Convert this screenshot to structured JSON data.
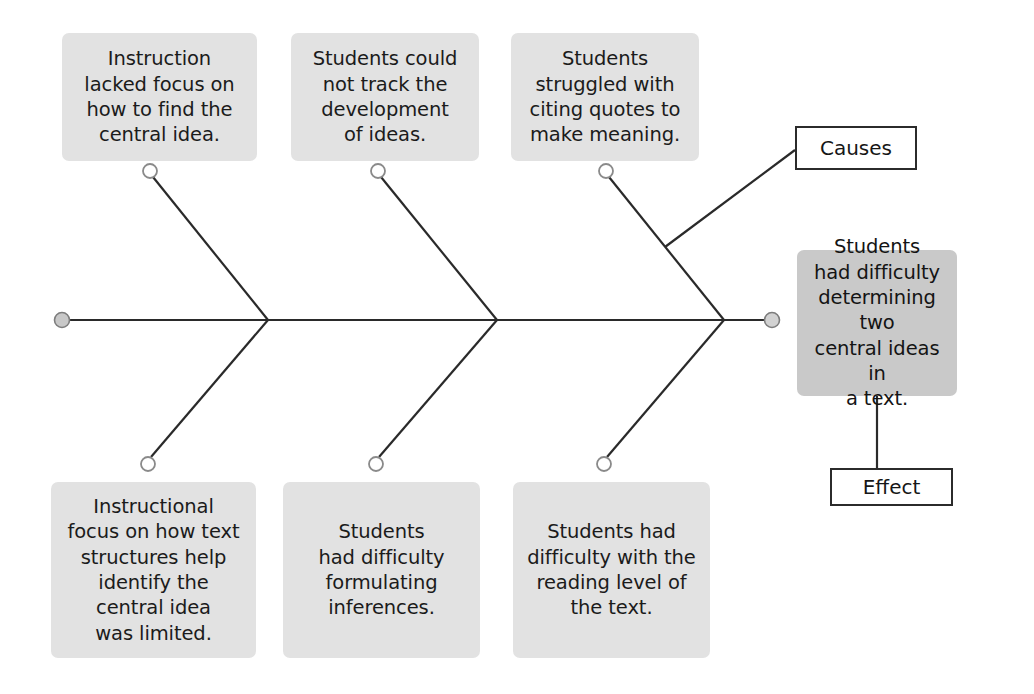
{
  "diagram": {
    "type": "fishbone-cause-and-effect",
    "title": "",
    "background_color": "#ffffff",
    "cause_box_color": "#e2e2e2",
    "effect_box_color": "#c9c9c9",
    "line_color": "#2a2a2a",
    "node_fill_color": "#ffffff",
    "node_stroke_color": "#8a8a8a",
    "spine_cap_fill_color": "#c8c8c8"
  },
  "labels": {
    "causes": "Causes",
    "effect": "Effect"
  },
  "causes_top": [
    {
      "id": "cause-top-1",
      "text": "Instruction\nlacked focus on\nhow to find the\ncentral idea."
    },
    {
      "id": "cause-top-2",
      "text": "Students could\nnot track the\ndevelopment\nof ideas."
    },
    {
      "id": "cause-top-3",
      "text": "Students\nstruggled with\nciting quotes to\nmake meaning."
    }
  ],
  "causes_bottom": [
    {
      "id": "cause-bottom-1",
      "text": "Instructional\nfocus on how text\nstructures help\nidentify the\ncentral idea\nwas limited."
    },
    {
      "id": "cause-bottom-2",
      "text": "Students\nhad difficulty\nformulating\ninferences."
    },
    {
      "id": "cause-bottom-3",
      "text": "Students had\ndifficulty with the\nreading level of\nthe text."
    }
  ],
  "effect": {
    "id": "effect-statement",
    "text": "Students\nhad difficulty\ndetermining two\ncentral ideas in\na text."
  }
}
